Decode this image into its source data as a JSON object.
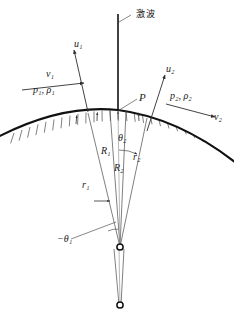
{
  "figure": {
    "title_label": "激波",
    "point_label": "P",
    "colors": {
      "line": "#3a3a3a",
      "body_curve": "#111111",
      "hatch": "#444444",
      "shock": "#111111",
      "text": "#1a1a1a"
    }
  },
  "upstream": {
    "normal_velocity": "u",
    "normal_velocity_sub": "1",
    "tangential_velocity": "v",
    "tangential_velocity_sub": "1",
    "state_label": "p₁, ρ₁",
    "radius_shock": "R",
    "radius_shock_sub": "1",
    "radius_body": "r",
    "radius_body_sub": "1",
    "angle_label": "−θ₁"
  },
  "downstream": {
    "normal_velocity": "u",
    "normal_velocity_sub": "2",
    "tangential_velocity": "v",
    "tangential_velocity_sub": "2",
    "state_label": "p₂, ρ₂",
    "radius_shock": "R",
    "radius_shock_sub": "2",
    "radius_body": "r",
    "radius_body_sub": "2",
    "angle_label": "θ₂"
  },
  "labels": {
    "u1": "u₁",
    "v1": "v₁",
    "p1rho1": "p₁, ρ₁",
    "u2": "u₂",
    "v2": "v₂",
    "p2rho2": "p₂, ρ₂",
    "P": "P",
    "R1": "R₁",
    "R2": "R₂",
    "r1": "r₁",
    "r2": "r₂",
    "theta1": "−θ₁",
    "theta2": "θ₂",
    "shock": "激波"
  }
}
